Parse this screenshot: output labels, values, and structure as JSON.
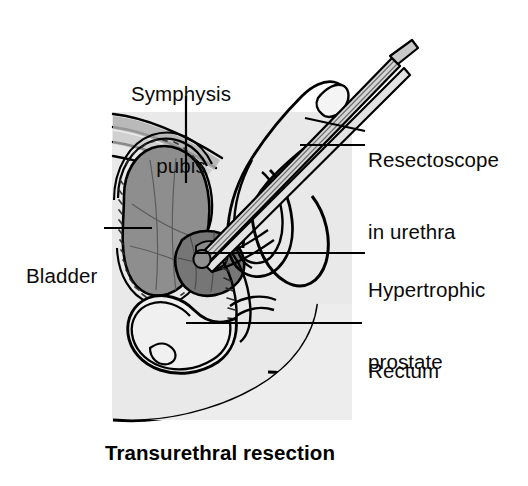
{
  "figure": {
    "caption": "Transurethral resection",
    "background_color": "#ffffff",
    "body_shade_color": "#e9e9e9",
    "ink_color": "#000000"
  },
  "labels": {
    "symphysis_pubis": {
      "line1": "Symphysis",
      "line2": "pubis"
    },
    "resectoscope": {
      "line1": "Resectoscope",
      "line2": "in urethra"
    },
    "bladder": {
      "line1": "Bladder"
    },
    "hypertrophic_prostate": {
      "line1": "Hypertrophic",
      "line2": "prostate"
    },
    "rectum": {
      "line1": "Rectum"
    }
  },
  "anatomy": {
    "bladder_fill": "#8c8c8c",
    "prostate_fill": "#7a7a7a",
    "bone_fill": "#dcdcdc",
    "muscle_fill": "#b4b4b4",
    "scope_fill": "#d2d2d2",
    "parts": [
      "bladder",
      "symphysis-pubis",
      "hypertrophic-prostate",
      "rectum",
      "resectoscope",
      "penis",
      "scrotum",
      "urethra",
      "abdominal-wall"
    ]
  }
}
